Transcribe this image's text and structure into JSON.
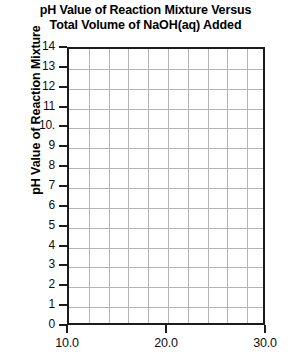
{
  "chart_data": {
    "type": "line",
    "title": "pH Value of Reaction Mixture Versus Total Volume of NaOH(aq) Added",
    "title_lines": [
      "pH Value of Reaction Mixture Versus",
      "Total Volume of NaOH(aq) Added"
    ],
    "xlabel": "",
    "ylabel": "pH Value of Reaction Mixture",
    "xlim": [
      10.0,
      30.0
    ],
    "ylim": [
      0,
      14
    ],
    "grid": true,
    "legend": false,
    "series": [],
    "x": [],
    "values": [],
    "note": "Blank grid template - no data plotted",
    "x_ticks": [
      {
        "value": 10.0,
        "label": "10.0"
      },
      {
        "value": 20.0,
        "label": "20.0"
      },
      {
        "value": 30.0,
        "label": "30.0"
      }
    ],
    "x_gridline_values": [
      12.0,
      14.0,
      16.0,
      18.0,
      20.0,
      22.0,
      24.0,
      26.0,
      28.0
    ],
    "x_grid_step": 2.0,
    "y_ticks": [
      {
        "value": 14,
        "label": "14"
      },
      {
        "value": 13,
        "label": "13"
      },
      {
        "value": 12,
        "label": "12"
      },
      {
        "value": 11,
        "label": "11"
      },
      {
        "value": 10,
        "label": "10."
      },
      {
        "value": 9,
        "label": "9"
      },
      {
        "value": 8,
        "label": "8"
      },
      {
        "value": 7,
        "label": "7"
      },
      {
        "value": 6,
        "label": "6"
      },
      {
        "value": 5,
        "label": "5"
      },
      {
        "value": 4,
        "label": "4"
      },
      {
        "value": 3,
        "label": "3"
      },
      {
        "value": 2,
        "label": "2"
      },
      {
        "value": 1,
        "label": "1"
      },
      {
        "value": 0,
        "label": "0"
      }
    ],
    "y_grid_step": 1,
    "colors": {
      "axis": "#1b1b1b",
      "gridline": "#b4b4b4",
      "text": "#0d0d0d",
      "background": "#ffffff"
    }
  }
}
